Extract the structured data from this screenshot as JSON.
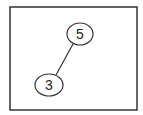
{
  "diagram": {
    "type": "binary-tree",
    "frame": {
      "x": 10,
      "y": 7,
      "width": 127,
      "height": 103,
      "stroke": "#333333"
    },
    "nodes": [
      {
        "id": "n5",
        "label": "5",
        "cx": 80,
        "cy": 34,
        "rx": 13,
        "ry": 11
      },
      {
        "id": "n3",
        "label": "3",
        "cx": 49,
        "cy": 85,
        "rx": 14,
        "ry": 11
      }
    ],
    "edges": [
      {
        "from": "n5",
        "to": "n3",
        "x1": 73,
        "y1": 44,
        "x2": 56,
        "y2": 75
      }
    ],
    "colors": {
      "stroke": "#333333",
      "text": "#222222",
      "background": "#ffffff"
    }
  }
}
